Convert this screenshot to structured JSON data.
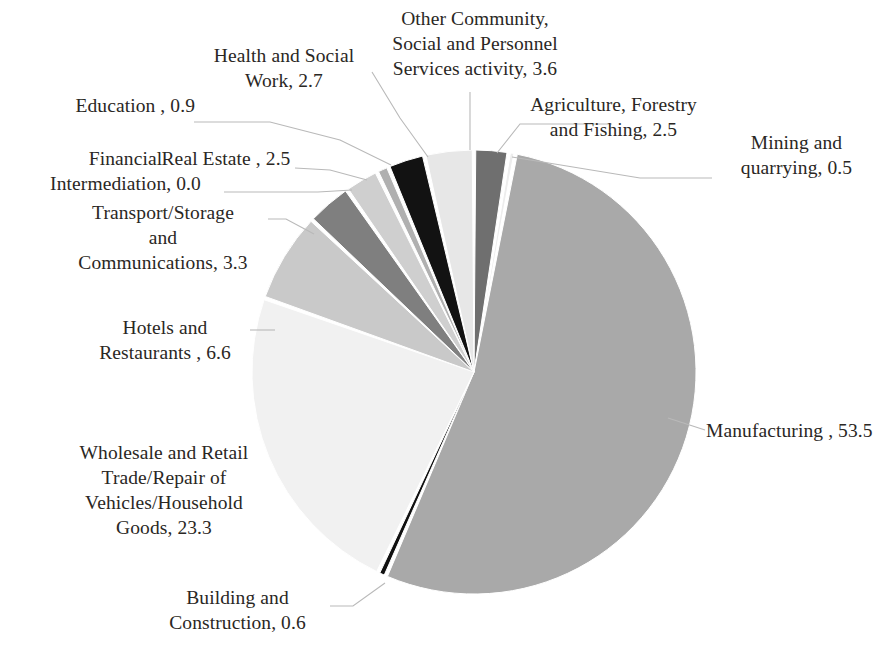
{
  "chart_data": {
    "type": "pie",
    "title": "",
    "subtitle": "",
    "xlabel": "",
    "ylabel": "",
    "legend_position": "none",
    "grid": false,
    "units": "percent",
    "label_format": "{name}, {value}",
    "start_angle_deg": 0,
    "direction": "clockwise",
    "categories": [
      "Agriculture, Forestry and Fishing",
      "Mining and quarrying",
      "Manufacturing",
      "Building and Construction",
      "Wholesale and Retail Trade/Repair of Vehicles/Household Goods",
      "Hotels and Restaurants",
      "Transport/Storage and Communications",
      "Financial Intermediation",
      "Real Estate",
      "Education",
      "Health and Social Work",
      "Other Community, Social and Personnel Services activity"
    ],
    "values": [
      2.5,
      0.5,
      53.5,
      0.6,
      23.3,
      6.6,
      3.3,
      0.0,
      2.5,
      0.9,
      2.7,
      3.6
    ],
    "colors": [
      "#6f6f6f",
      "#ededed",
      "#a9a9a9",
      "#111111",
      "#f1f1f1",
      "#c9c9c9",
      "#7f7f7f",
      "#d9d9d9",
      "#cfcfcf",
      "#b0b0b0",
      "#121212",
      "#e7e7e7"
    ],
    "slice_border": "#ffffff",
    "total": 100.0
  },
  "labels": {
    "agriculture": "Agriculture, Forestry\nand Fishing, 2.5",
    "mining": "Mining and\nquarrying, 0.5",
    "manufacturing": "Manufacturing , 53.5",
    "building": "Building and\nConstruction, 0.6",
    "wholesale": "Wholesale and Retail\nTrade/Repair of\nVehicles/Household\nGoods, 23.3",
    "hotels": "Hotels and\nRestaurants , 6.6",
    "transport": "Transport/Storage\nand\nCommunications, 3.3",
    "financial": "Financial\nIntermediation, 0.0",
    "realestate": "Real Estate , 2.5",
    "education": "Education , 0.9",
    "health": "Health and Social\nWork, 2.7",
    "other": "Other Community,\nSocial and Personnel\nServices activity, 3.6"
  }
}
